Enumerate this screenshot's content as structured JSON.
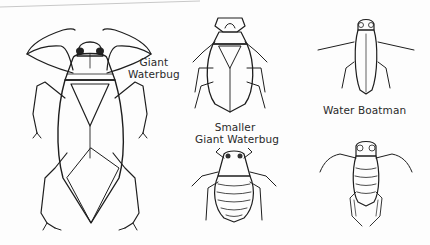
{
  "illustration": {
    "labels": {
      "giant_waterbug": [
        "Giant",
        "Waterbug"
      ],
      "smaller_giant_waterbug": [
        "Smaller",
        "Giant Waterbug"
      ],
      "water_boatman": "Water Boatman"
    },
    "figures": [
      {
        "id": "giant-waterbug",
        "view": "dorsal"
      },
      {
        "id": "smaller-giant-waterbug",
        "view": "dorsal"
      },
      {
        "id": "smaller-giant-waterbug",
        "view": "ventral"
      },
      {
        "id": "water-boatman",
        "view": "dorsal"
      },
      {
        "id": "water-boatman",
        "view": "ventral"
      }
    ],
    "colors": {
      "ink": "#1e1e1e",
      "background": "#fdfdfd",
      "shading": "#9a9a9a"
    }
  }
}
